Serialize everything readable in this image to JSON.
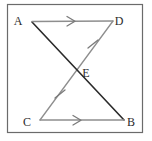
{
  "figure": {
    "canvas": {
      "width": 152,
      "height": 141
    },
    "colors": {
      "background": "#ffffff",
      "frame": "#6b6b6b",
      "dark_line": "#2a2a2a",
      "light_line": "#8e8e8e",
      "label": "#2b2b2b",
      "mark": "#7a7a7a"
    },
    "frame": {
      "name": "image-border",
      "left": 7,
      "top": 4,
      "right": 143,
      "bottom": 133
    },
    "points": [
      {
        "id": "A",
        "label": "A",
        "x": 32,
        "y": 22,
        "label_x": 18,
        "label_y": 22
      },
      {
        "id": "D",
        "label": "D",
        "x": 113,
        "y": 21,
        "label_x": 117,
        "label_y": 22
      },
      {
        "id": "E",
        "label": "E",
        "x": 77,
        "y": 69,
        "label_x": 83,
        "label_y": 74
      },
      {
        "id": "C",
        "label": "C",
        "x": 40,
        "y": 120,
        "label_x": 26,
        "label_y": 124
      },
      {
        "id": "B",
        "label": "B",
        "x": 124,
        "y": 120,
        "label_x": 128,
        "label_y": 124
      }
    ],
    "segments": [
      {
        "id": "AD",
        "label": "A to D",
        "from": "A",
        "to": "D",
        "style": "light",
        "mark": "single-arrow"
      },
      {
        "id": "CB",
        "label": "C to B",
        "from": "C",
        "to": "B",
        "style": "light",
        "mark": "single-arrow"
      },
      {
        "id": "AB",
        "label": "A to B",
        "from": "A",
        "to": "B",
        "style": "dark",
        "mark": "none"
      },
      {
        "id": "DC",
        "label": "D to C",
        "from": "D",
        "to": "C",
        "style": "light",
        "mark": "none"
      }
    ],
    "marks": {
      "arrow_ad": {
        "name": "parallel-arrow-ad",
        "x": 72,
        "y": 21,
        "angle": 0
      },
      "arrow_cb": {
        "name": "parallel-arrow-cb",
        "x": 78,
        "y": 120,
        "angle": 0
      },
      "tick_de": {
        "name": "congruence-tick-de",
        "x": 93,
        "y": 44,
        "angle": 60
      },
      "tick_ec": {
        "name": "congruence-tick-ec",
        "x": 60,
        "y": 94,
        "angle": 60
      }
    },
    "notes": {
      "parallel_pair": "AD is parallel to CB",
      "congruent_pair": "DE is congruent to EC",
      "intersection": "AB and DC intersect at E"
    }
  }
}
